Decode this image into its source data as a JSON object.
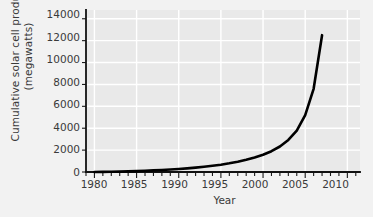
{
  "chart_data": {
    "type": "line",
    "title": "",
    "xlabel": "Year",
    "ylabel": "Cumulative solar cell production (megawatts)",
    "ylabel_line1": "Cumulative solar cell production",
    "ylabel_line2": "(megawatts)",
    "xlim": [
      1979,
      2011.5
    ],
    "ylim": [
      0,
      14800
    ],
    "xticks": [
      1980,
      1985,
      1990,
      1995,
      2000,
      2005,
      2010
    ],
    "xticklabels": [
      "1980",
      "1985",
      "1990",
      "1995",
      "2000",
      "2005",
      "2010"
    ],
    "xminor_tick_step": 1,
    "yticks": [
      0,
      2000,
      4000,
      6000,
      8000,
      10000,
      12000,
      14000
    ],
    "yticklabels": [
      "0",
      "2000",
      "4000",
      "6000",
      "8000",
      "10000",
      "12000",
      "14000"
    ],
    "grid": true,
    "grid_color": "#ffffff",
    "plot_background": "#e9e9e9",
    "figure_background": "#f2f2f2",
    "line_color": "#000000",
    "line_width": 2.6,
    "legend": null,
    "series": [
      {
        "name": "Cumulative solar cell production",
        "x": [
          1980,
          1981,
          1982,
          1983,
          1984,
          1985,
          1986,
          1987,
          1988,
          1989,
          1990,
          1991,
          1992,
          1993,
          1994,
          1995,
          1996,
          1997,
          1998,
          1999,
          2000,
          2001,
          2002,
          2003,
          2004,
          2005,
          2006,
          2007
        ],
        "values": [
          5,
          12,
          22,
          36,
          55,
          80,
          110,
          145,
          185,
          230,
          280,
          335,
          400,
          475,
          565,
          670,
          795,
          940,
          1115,
          1320,
          1570,
          1900,
          2330,
          2930,
          3780,
          5200,
          7600,
          12500
        ]
      }
    ]
  },
  "axes": {
    "ytick_0": "0",
    "ytick_1": "2000",
    "ytick_2": "4000",
    "ytick_3": "6000",
    "ytick_4": "8000",
    "ytick_5": "10000",
    "ytick_6": "12000",
    "ytick_7": "14000",
    "xtick_0": "1980",
    "xtick_1": "1985",
    "xtick_2": "1990",
    "xtick_3": "1995",
    "xtick_4": "2000",
    "xtick_5": "2005",
    "xtick_6": "2010"
  }
}
